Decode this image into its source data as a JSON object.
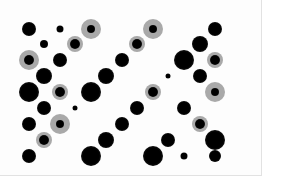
{
  "figure": {
    "background": "#ffffff",
    "frame_border": "#e2e2e2",
    "core_color": "#0a0a0a",
    "halo_color": "#a9a9a9"
  },
  "dots": [
    {
      "x": 29,
      "y": 29,
      "r": 7,
      "halo": 0
    },
    {
      "x": 60,
      "y": 29,
      "r": 3.5,
      "halo": 0
    },
    {
      "x": 91,
      "y": 29,
      "r": 4,
      "halo": 10
    },
    {
      "x": 153,
      "y": 29,
      "r": 4,
      "halo": 10
    },
    {
      "x": 215,
      "y": 29,
      "r": 7,
      "halo": 0
    },
    {
      "x": 44,
      "y": 44,
      "r": 4,
      "halo": 0
    },
    {
      "x": 75,
      "y": 44,
      "r": 5,
      "halo": 8
    },
    {
      "x": 137,
      "y": 44,
      "r": 5,
      "halo": 8
    },
    {
      "x": 200,
      "y": 44,
      "r": 8,
      "halo": 0
    },
    {
      "x": 29,
      "y": 60,
      "r": 5,
      "halo": 10
    },
    {
      "x": 60,
      "y": 60,
      "r": 7,
      "halo": 0
    },
    {
      "x": 122,
      "y": 60,
      "r": 7,
      "halo": 0
    },
    {
      "x": 184,
      "y": 60,
      "r": 10,
      "halo": 0
    },
    {
      "x": 215,
      "y": 60,
      "r": 5,
      "halo": 8
    },
    {
      "x": 44,
      "y": 76,
      "r": 8,
      "halo": 0
    },
    {
      "x": 106,
      "y": 76,
      "r": 8,
      "halo": 0
    },
    {
      "x": 168,
      "y": 76,
      "r": 2.5,
      "halo": 0
    },
    {
      "x": 200,
      "y": 76,
      "r": 7,
      "halo": 0
    },
    {
      "x": 29,
      "y": 92,
      "r": 10,
      "halo": 0
    },
    {
      "x": 60,
      "y": 92,
      "r": 5,
      "halo": 8
    },
    {
      "x": 91,
      "y": 92,
      "r": 10,
      "halo": 0
    },
    {
      "x": 153,
      "y": 92,
      "r": 5,
      "halo": 8
    },
    {
      "x": 215,
      "y": 92,
      "r": 4,
      "halo": 10
    },
    {
      "x": 44,
      "y": 108,
      "r": 7,
      "halo": 0
    },
    {
      "x": 75,
      "y": 108,
      "r": 2.5,
      "halo": 0
    },
    {
      "x": 137,
      "y": 108,
      "r": 7,
      "halo": 0
    },
    {
      "x": 184,
      "y": 108,
      "r": 7,
      "halo": 0
    },
    {
      "x": 29,
      "y": 124,
      "r": 7,
      "halo": 0
    },
    {
      "x": 60,
      "y": 124,
      "r": 4,
      "halo": 10
    },
    {
      "x": 122,
      "y": 124,
      "r": 7,
      "halo": 0
    },
    {
      "x": 200,
      "y": 124,
      "r": 5,
      "halo": 8
    },
    {
      "x": 44,
      "y": 140,
      "r": 5,
      "halo": 8
    },
    {
      "x": 106,
      "y": 140,
      "r": 8,
      "halo": 0
    },
    {
      "x": 168,
      "y": 140,
      "r": 7,
      "halo": 0
    },
    {
      "x": 215,
      "y": 140,
      "r": 10,
      "halo": 0
    },
    {
      "x": 29,
      "y": 156,
      "r": 7,
      "halo": 0
    },
    {
      "x": 91,
      "y": 156,
      "r": 10,
      "halo": 0
    },
    {
      "x": 153,
      "y": 156,
      "r": 10,
      "halo": 0
    },
    {
      "x": 184,
      "y": 156,
      "r": 3.5,
      "halo": 0
    },
    {
      "x": 215,
      "y": 156,
      "r": 6,
      "halo": 0
    }
  ]
}
